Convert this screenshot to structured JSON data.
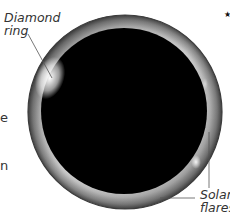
{
  "diagram": {
    "labels": {
      "diamond_ring_line1": "Diamond",
      "diamond_ring_line2": "ring",
      "solar_flares_line1": "Solar",
      "solar_flares_line2": "flares"
    },
    "left_text_fragments": [
      "e",
      "n"
    ],
    "marker": "★",
    "colors": {
      "moon_disk": "#000000",
      "corona_outer": "#5a5a5a",
      "corona_inner": "#d8d8d8",
      "label_text": "#333333",
      "leader_line": "#555555",
      "background": "#ffffff"
    }
  }
}
